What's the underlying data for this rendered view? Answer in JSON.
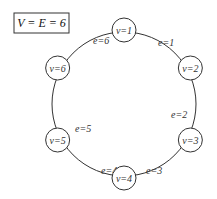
{
  "title": "V = E = 6",
  "nodes": [
    {
      "label": "v=1"
    },
    {
      "label": "v=2"
    },
    {
      "label": "v=3"
    },
    {
      "label": "v=4"
    },
    {
      "label": "v=5"
    },
    {
      "label": "v=6"
    }
  ],
  "edges": [
    {
      "label": "e=1",
      "from": 1,
      "to": 2
    },
    {
      "label": "e=2",
      "from": 2,
      "to": 3
    },
    {
      "label": "e=3",
      "from": 3,
      "to": 4
    },
    {
      "label": "e=4",
      "from": 4,
      "to": 5
    },
    {
      "label": "e=5",
      "from": 5,
      "to": 6
    },
    {
      "label": "e=6",
      "from": 6,
      "to": 1
    }
  ],
  "colors": {
    "stroke": "#333333",
    "node_fill": "#ffffff",
    "text": "#222222"
  }
}
